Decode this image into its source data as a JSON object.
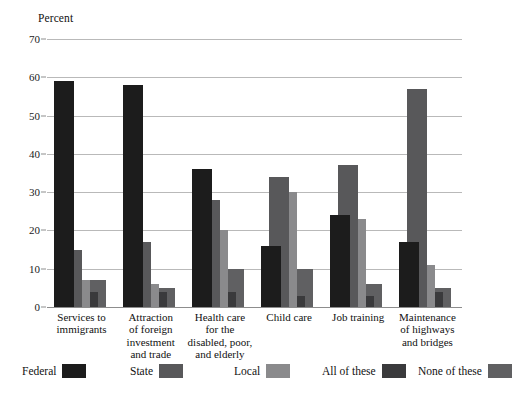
{
  "chart_data": {
    "type": "bar",
    "title": "",
    "subtitle": "",
    "xlabel": "",
    "ylabel": "Percent",
    "ylim": [
      0,
      70
    ],
    "yticks": [
      0,
      10,
      20,
      30,
      40,
      50,
      60,
      70
    ],
    "grid": true,
    "legend_position": "bottom",
    "categories": [
      "Services to immigrants",
      "Attraction of foreign investment and trade",
      "Health care for the disabled, poor, and elderly",
      "Child care",
      "Job training",
      "Maintenance of highways and bridges"
    ],
    "category_label_lines": [
      [
        "Services to",
        "immigrants"
      ],
      [
        "Attraction",
        "of foreign",
        "investment",
        "and trade"
      ],
      [
        "Health care",
        "for the",
        "disabled, poor,",
        "and elderly"
      ],
      [
        "Child care"
      ],
      [
        "Job training"
      ],
      [
        "Maintenance",
        "of highways",
        "and bridges"
      ]
    ],
    "series": [
      {
        "name": "Federal",
        "color": "#1c1c1c",
        "values": [
          59,
          58,
          36,
          16,
          24,
          17
        ]
      },
      {
        "name": "State",
        "color": "#58585a",
        "values": [
          15,
          17,
          28,
          34,
          37,
          57
        ]
      },
      {
        "name": "Local",
        "color": "#8a8a8c",
        "values": [
          7,
          6,
          20,
          30,
          23,
          11
        ]
      },
      {
        "name": "All of these",
        "color": "#3a3a3c",
        "values": [
          4,
          4,
          4,
          3,
          3,
          4
        ]
      },
      {
        "name": "None of these",
        "color": "#606062",
        "values": [
          7,
          5,
          10,
          10,
          6,
          5
        ]
      }
    ]
  },
  "legend": {
    "items": [
      {
        "label": "Federal",
        "color": "#1c1c1c"
      },
      {
        "label": "State",
        "color": "#58585a"
      },
      {
        "label": "Local",
        "color": "#8a8a8c"
      },
      {
        "label": "All of these",
        "color": "#3a3a3c"
      },
      {
        "label": "None of these",
        "color": "#606062"
      }
    ]
  }
}
